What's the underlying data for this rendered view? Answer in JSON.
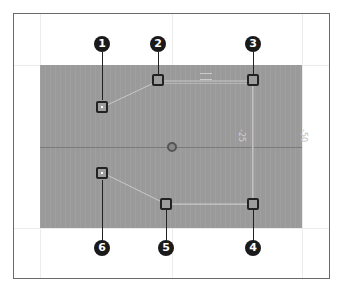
{
  "diagram": {
    "colors": {
      "canvas": "#9a9a9a",
      "frame": "#6a6a6a",
      "handle_border": "#222222",
      "callout_fill": "#1a1a1a",
      "connector": "#c8c8c8"
    },
    "axis_labels": {
      "right_inner": "-25",
      "right_outer": "-50"
    },
    "callouts": [
      {
        "number": "1",
        "target": "handle-1"
      },
      {
        "number": "2",
        "target": "handle-2"
      },
      {
        "number": "3",
        "target": "handle-3"
      },
      {
        "number": "4",
        "target": "handle-4"
      },
      {
        "number": "5",
        "target": "handle-5"
      },
      {
        "number": "6",
        "target": "handle-6"
      }
    ]
  }
}
